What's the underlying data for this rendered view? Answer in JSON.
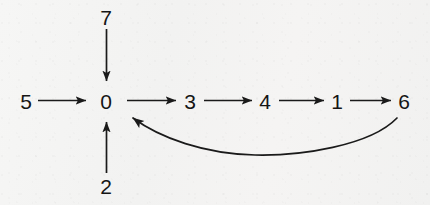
{
  "diagram": {
    "type": "directed-graph",
    "title": "",
    "background_color": "#f4f4f3",
    "stroke_color": "#1a1a1a",
    "nodes": [
      {
        "id": "n5",
        "label": "5",
        "x": 26,
        "y": 101
      },
      {
        "id": "n0",
        "label": "0",
        "x": 106,
        "y": 101
      },
      {
        "id": "n3",
        "label": "3",
        "x": 190,
        "y": 101
      },
      {
        "id": "n4",
        "label": "4",
        "x": 265,
        "y": 101
      },
      {
        "id": "n1",
        "label": "1",
        "x": 337,
        "y": 101
      },
      {
        "id": "n6",
        "label": "6",
        "x": 404,
        "y": 101
      },
      {
        "id": "n7",
        "label": "7",
        "x": 106,
        "y": 17
      },
      {
        "id": "n2",
        "label": "2",
        "x": 106,
        "y": 186
      }
    ],
    "edges": [
      {
        "id": "e5_0",
        "from": "5",
        "to": "0",
        "shape": "straight",
        "direction": "right"
      },
      {
        "id": "e0_3",
        "from": "0",
        "to": "3",
        "shape": "straight",
        "direction": "right"
      },
      {
        "id": "e3_4",
        "from": "3",
        "to": "4",
        "shape": "straight",
        "direction": "right"
      },
      {
        "id": "e4_1",
        "from": "4",
        "to": "1",
        "shape": "straight",
        "direction": "right"
      },
      {
        "id": "e1_6",
        "from": "1",
        "to": "6",
        "shape": "straight",
        "direction": "right"
      },
      {
        "id": "e7_0",
        "from": "7",
        "to": "0",
        "shape": "straight",
        "direction": "down"
      },
      {
        "id": "e2_0",
        "from": "2",
        "to": "0",
        "shape": "straight",
        "direction": "up"
      },
      {
        "id": "e6_0",
        "from": "6",
        "to": "0",
        "shape": "curved",
        "direction": "left"
      }
    ]
  }
}
